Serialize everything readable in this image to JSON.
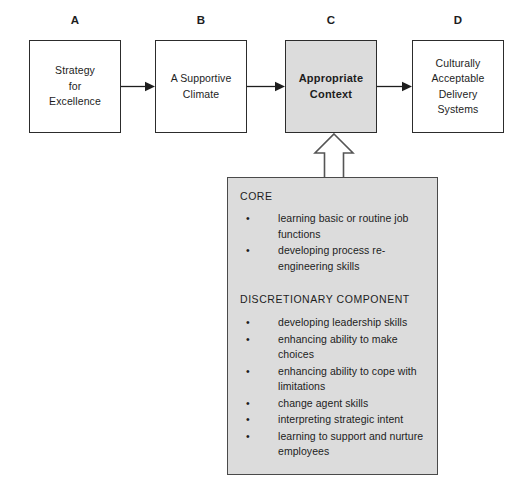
{
  "diagram": {
    "flow_boxes": [
      {
        "caption": "A",
        "label": "Strategy\nfor\nExcellence",
        "shaded": false
      },
      {
        "caption": "B",
        "label": "A Supportive\nClimate",
        "shaded": false
      },
      {
        "caption": "C",
        "label": "Appropriate\nContext",
        "shaded": true
      },
      {
        "caption": "D",
        "label": "Culturally\nAcceptable\nDelivery\nSystems",
        "shaded": false
      }
    ],
    "panel": {
      "core_heading": "CORE",
      "core_items": [
        "learning basic or routine job functions",
        "developing process re-engineering skills"
      ],
      "discretionary_heading": "DISCRETIONARY COMPONENT",
      "discretionary_items": [
        "developing leadership skills",
        "enhancing ability to make choices",
        "enhancing ability to cope with limitations",
        "change agent skills",
        "interpreting strategic intent",
        "learning to support and nurture employees"
      ],
      "bullet_glyph": "•"
    },
    "colors": {
      "shade_fill": "#dcdcdc",
      "box_stroke": "#2c2c2c",
      "panel_stroke": "#4a4a4a",
      "text": "#1d1d1d",
      "arrow": "#1d1d1d"
    }
  }
}
